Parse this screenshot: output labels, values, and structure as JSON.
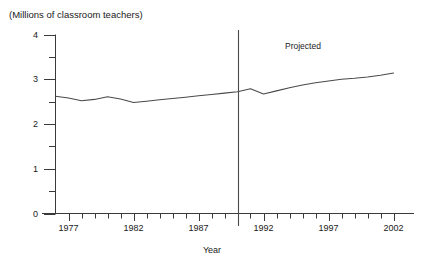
{
  "chart_data": {
    "type": "line",
    "title": "(Millions of classroom teachers)",
    "xlabel": "Year",
    "ylabel": "(Millions of classroom teachers)",
    "xlim": [
      1976,
      2002
    ],
    "ylim": [
      0,
      4
    ],
    "grid": false,
    "legend": null,
    "y_ticks": [
      0,
      1,
      2,
      3,
      4
    ],
    "y_tick_labels": [
      "0",
      "1",
      "2",
      "3",
      "4"
    ],
    "y_minor_ticks": [
      0.5,
      1.5,
      2.5,
      3.5
    ],
    "x_ticks": [
      1977,
      1982,
      1987,
      1992,
      1997,
      2002
    ],
    "x_tick_labels": [
      "1977",
      "1982",
      "1987",
      "1992",
      "1997",
      "2002"
    ],
    "x_minor_ticks": [
      1978,
      1979,
      1980,
      1981,
      1983,
      1984,
      1985,
      1986,
      1988,
      1989,
      1990,
      1991,
      1993,
      1994,
      1995,
      1996,
      1998,
      1999,
      2000,
      2001
    ],
    "annotations": [
      {
        "text": "Projected",
        "x": 1995.5,
        "y": 3.72
      }
    ],
    "divider": {
      "x": 1990,
      "label": "Projected",
      "style": "solid"
    },
    "series": [
      {
        "name": "Classroom teachers",
        "color": "#4a4a4a",
        "x": [
          1976,
          1977,
          1978,
          1979,
          1980,
          1981,
          1982,
          1983,
          1984,
          1985,
          1986,
          1987,
          1988,
          1989,
          1990,
          1991,
          1992,
          1993,
          1994,
          1995,
          1996,
          1997,
          1998,
          1999,
          2000,
          2001,
          2002
        ],
        "values": [
          2.62,
          2.58,
          2.52,
          2.55,
          2.61,
          2.56,
          2.48,
          2.51,
          2.54,
          2.57,
          2.6,
          2.63,
          2.66,
          2.69,
          2.72,
          2.79,
          2.67,
          2.74,
          2.81,
          2.87,
          2.92,
          2.96,
          3.0,
          3.02,
          3.05,
          3.09,
          3.14
        ]
      }
    ]
  },
  "axes": {
    "y_title": "(Millions of classroom teachers)",
    "x_title": "Year"
  },
  "labels": {
    "projected": "Projected"
  }
}
